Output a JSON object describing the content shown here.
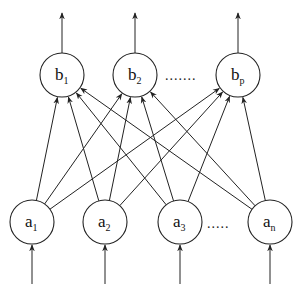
{
  "diagram": {
    "title": "",
    "type": "two-layer fully connected network",
    "output_layer": {
      "nodes": [
        {
          "id": "b1",
          "base": "b",
          "sub": "1",
          "cx": 62,
          "cy": 75
        },
        {
          "id": "b2",
          "base": "b",
          "sub": "2",
          "cx": 135,
          "cy": 75
        },
        {
          "id": "bp",
          "base": "b",
          "sub": "p",
          "cx": 238,
          "cy": 75
        }
      ],
      "ellipsis": {
        "text": ".......",
        "x": 165,
        "y": 80
      },
      "output_arrows": true
    },
    "input_layer": {
      "nodes": [
        {
          "id": "a1",
          "base": "a",
          "sub": "1",
          "cx": 32,
          "cy": 222
        },
        {
          "id": "a2",
          "base": "a",
          "sub": "2",
          "cx": 105,
          "cy": 222
        },
        {
          "id": "a3",
          "base": "a",
          "sub": "3",
          "cx": 180,
          "cy": 222
        },
        {
          "id": "an",
          "base": "a",
          "sub": "n",
          "cx": 270,
          "cy": 222
        }
      ],
      "ellipsis": {
        "text": ".....",
        "x": 207,
        "y": 228
      },
      "input_arrows": true
    },
    "radius": 22,
    "connections": "every a node connects to every b node",
    "colors": {
      "stroke": "#222222",
      "background": "#ffffff"
    }
  }
}
